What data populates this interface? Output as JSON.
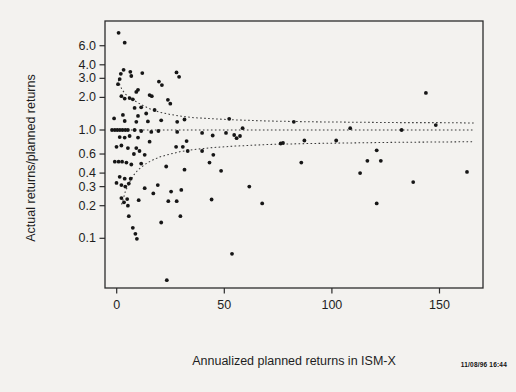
{
  "chart_data": {
    "type": "scatter",
    "title": "",
    "xlabel": "Annualized planned returns in ISM-X",
    "ylabel": "Actual returns/planned returns",
    "x_ticks": [
      0,
      50,
      100,
      150
    ],
    "x_tick_labels": [
      "0",
      "50",
      "100",
      "150"
    ],
    "y_ticks": [
      6,
      4,
      3,
      2,
      1,
      0.6,
      0.4,
      0.3,
      0.2,
      0.1
    ],
    "y_tick_labels": [
      "6.0",
      "4.0",
      "3.0",
      "2.0",
      "1.0",
      "0.6",
      "0.4",
      "0.3",
      "0.2",
      "0.1"
    ],
    "y_scale": "log",
    "xlim": [
      -5.4,
      170
    ],
    "ylim": [
      0.035,
      10.2
    ],
    "grid": false,
    "legend": null,
    "marker_color": "#161616",
    "band_color": "#3a3a3a",
    "points": [
      [
        0.9,
        7.9
      ],
      [
        3.7,
        6.4
      ],
      [
        3.2,
        3.6
      ],
      [
        1.9,
        3.3
      ],
      [
        6.3,
        3.45
      ],
      [
        6.8,
        3.15
      ],
      [
        11.9,
        3.35
      ],
      [
        1.4,
        2.95
      ],
      [
        0.6,
        2.65
      ],
      [
        19.6,
        2.8
      ],
      [
        21,
        2.6
      ],
      [
        27.8,
        3.4
      ],
      [
        29,
        3.1
      ],
      [
        9.1,
        2.25
      ],
      [
        9.9,
        2.35
      ],
      [
        15.3,
        2.1
      ],
      [
        16.3,
        2.05
      ],
      [
        2.2,
        2.05
      ],
      [
        3.7,
        1.95
      ],
      [
        6,
        1.97
      ],
      [
        7.5,
        1.92
      ],
      [
        11.4,
        1.62
      ],
      [
        23.8,
        1.9
      ],
      [
        24.9,
        1.75
      ],
      [
        17.6,
        1.53
      ],
      [
        8.3,
        1.6
      ],
      [
        2.9,
        1.38
      ],
      [
        9.9,
        1.35
      ],
      [
        13.7,
        1.42
      ],
      [
        -1.2,
        1.28
      ],
      [
        3.7,
        1.21
      ],
      [
        9.1,
        1.19
      ],
      [
        14.5,
        1.2
      ],
      [
        20.7,
        1.23
      ],
      [
        28.1,
        1.19
      ],
      [
        31.5,
        1.25
      ],
      [
        52.3,
        1.27
      ],
      [
        82.3,
        1.19
      ],
      [
        148.3,
        1.11
      ],
      [
        143.7,
        2.2
      ],
      [
        -2.2,
        1
      ],
      [
        -0.9,
        1
      ],
      [
        0.3,
        1
      ],
      [
        1.5,
        1
      ],
      [
        2.7,
        1
      ],
      [
        4,
        1
      ],
      [
        5.2,
        1
      ],
      [
        8.3,
        1
      ],
      [
        11.4,
        0.98
      ],
      [
        16.1,
        0.96
      ],
      [
        19.4,
        0.98
      ],
      [
        28.1,
        0.96
      ],
      [
        58.5,
        1.04
      ],
      [
        108.5,
        1.04
      ],
      [
        132.4,
        1
      ],
      [
        1.4,
        0.86
      ],
      [
        3.7,
        0.85
      ],
      [
        6,
        0.88
      ],
      [
        9.9,
        0.85
      ],
      [
        15.3,
        0.78
      ],
      [
        32.5,
        0.79
      ],
      [
        39.7,
        0.94
      ],
      [
        44.6,
        0.89
      ],
      [
        50.8,
        0.94
      ],
      [
        54.6,
        0.9
      ],
      [
        55.7,
        0.84
      ],
      [
        57.3,
        0.88
      ],
      [
        76.2,
        0.75
      ],
      [
        77.3,
        0.76
      ],
      [
        87.2,
        0.8
      ],
      [
        102,
        0.8
      ],
      [
        2.2,
        0.72
      ],
      [
        -0.1,
        0.7
      ],
      [
        5.2,
        0.68
      ],
      [
        9.1,
        0.68
      ],
      [
        10.6,
        0.64
      ],
      [
        8,
        0.6
      ],
      [
        13,
        0.59
      ],
      [
        27.6,
        0.7
      ],
      [
        30.7,
        0.7
      ],
      [
        33,
        0.64
      ],
      [
        39.7,
        0.64
      ],
      [
        44.9,
        0.59
      ],
      [
        120.8,
        0.65
      ],
      [
        -0.9,
        0.51
      ],
      [
        0.9,
        0.51
      ],
      [
        2.5,
        0.51
      ],
      [
        4.5,
        0.5
      ],
      [
        6.8,
        0.48
      ],
      [
        11.4,
        0.49
      ],
      [
        23,
        0.46
      ],
      [
        31.5,
        0.43
      ],
      [
        43.1,
        0.5
      ],
      [
        48.5,
        0.42
      ],
      [
        85.8,
        0.5
      ],
      [
        116.5,
        0.52
      ],
      [
        122.7,
        0.52
      ],
      [
        162.8,
        0.41
      ],
      [
        113.1,
        0.4
      ],
      [
        1.4,
        0.37
      ],
      [
        3.7,
        0.355
      ],
      [
        6.5,
        0.355
      ],
      [
        5.6,
        0.32
      ],
      [
        -0.1,
        0.325
      ],
      [
        2.2,
        0.31
      ],
      [
        4,
        0.3
      ],
      [
        13,
        0.29
      ],
      [
        17,
        0.26
      ],
      [
        19.1,
        0.31
      ],
      [
        25.3,
        0.27
      ],
      [
        30,
        0.28
      ],
      [
        61.6,
        0.3
      ],
      [
        137.8,
        0.33
      ],
      [
        2.2,
        0.235
      ],
      [
        4.9,
        0.23
      ],
      [
        3.4,
        0.215
      ],
      [
        10.2,
        0.225
      ],
      [
        24,
        0.22
      ],
      [
        27.9,
        0.22
      ],
      [
        44.1,
        0.228
      ],
      [
        67.6,
        0.21
      ],
      [
        120.8,
        0.21
      ],
      [
        5.2,
        0.2
      ],
      [
        5.6,
        0.16
      ],
      [
        7.5,
        0.125
      ],
      [
        8.7,
        0.11
      ],
      [
        9.4,
        0.099
      ],
      [
        20.7,
        0.14
      ],
      [
        29.6,
        0.16
      ],
      [
        53.6,
        0.072
      ],
      [
        23.3,
        0.041
      ]
    ],
    "bands": {
      "upper": [
        [
          0.8,
          2.9
        ],
        [
          1.5,
          2.6
        ],
        [
          2.5,
          2.35
        ],
        [
          4,
          2.15
        ],
        [
          6,
          2
        ],
        [
          8,
          1.88
        ],
        [
          10,
          1.78
        ],
        [
          13,
          1.65
        ],
        [
          16,
          1.55
        ],
        [
          20,
          1.46
        ],
        [
          25,
          1.39
        ],
        [
          30,
          1.34
        ],
        [
          36,
          1.3
        ],
        [
          45,
          1.27
        ],
        [
          55,
          1.24
        ],
        [
          70,
          1.21
        ],
        [
          90,
          1.19
        ],
        [
          110,
          1.18
        ],
        [
          130,
          1.17
        ],
        [
          150,
          1.17
        ],
        [
          166,
          1.16
        ]
      ],
      "middle": [
        [
          1,
          1
        ],
        [
          166,
          1
        ]
      ],
      "lower": [
        [
          2.3,
          0.205
        ],
        [
          3,
          0.23
        ],
        [
          4,
          0.27
        ],
        [
          5,
          0.3
        ],
        [
          6,
          0.33
        ],
        [
          8,
          0.385
        ],
        [
          10,
          0.43
        ],
        [
          13,
          0.48
        ],
        [
          16,
          0.52
        ],
        [
          20,
          0.565
        ],
        [
          25,
          0.6
        ],
        [
          30,
          0.635
        ],
        [
          36,
          0.66
        ],
        [
          45,
          0.69
        ],
        [
          55,
          0.71
        ],
        [
          70,
          0.735
        ],
        [
          90,
          0.75
        ],
        [
          110,
          0.76
        ],
        [
          130,
          0.77
        ],
        [
          150,
          0.775
        ],
        [
          166,
          0.78
        ]
      ]
    }
  },
  "annotations": {
    "timestamp": "11/08/96 16:44"
  }
}
